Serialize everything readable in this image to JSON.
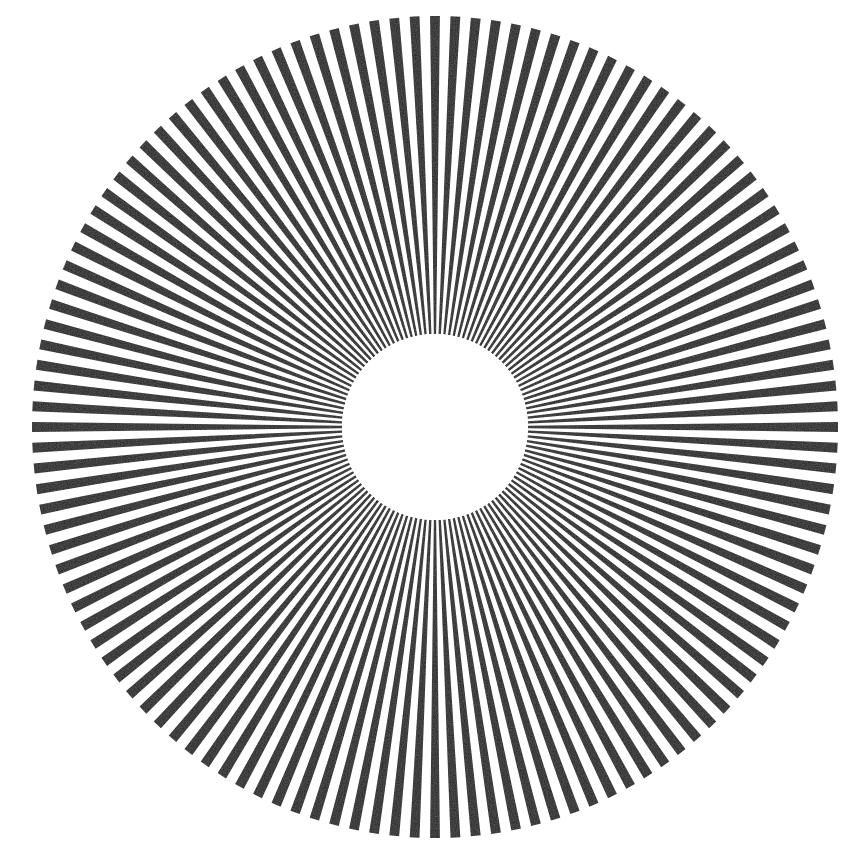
{
  "figure": {
    "name": "radial-sunburst",
    "canvas_width": 862,
    "canvas_height": 860
  },
  "colors": {
    "background": "#ffffff",
    "ray_fill": "#1a1a1a",
    "inner_disc": "#ffffff"
  },
  "chart_data": {
    "type": "pie",
    "subtitle": "",
    "xlabel": "",
    "ylabel": "",
    "legend": [],
    "annotations": [],
    "grid": false,
    "geometry": {
      "center_x": 435,
      "center_y": 427,
      "inner_radius": 93,
      "outer_radius_x": 403,
      "outer_radius_y": 411,
      "ray_count": 124,
      "angular_period_deg": 2.9032,
      "duty_cycle": 0.48,
      "start_angle_deg": -90,
      "tip_shape": "flat-cut",
      "converges_to_center": true
    },
    "categories": [
      "black-ray",
      "white-gap"
    ],
    "values": [
      48,
      52
    ]
  }
}
